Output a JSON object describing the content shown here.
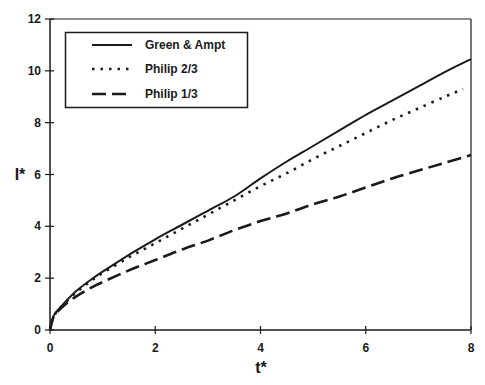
{
  "chart_data": {
    "type": "line",
    "title": "",
    "xlabel": "t*",
    "ylabel": "I*",
    "xlim": [
      0,
      8
    ],
    "ylim": [
      0,
      12
    ],
    "xticks": [
      0,
      2,
      4,
      6,
      8
    ],
    "yticks": [
      0,
      2,
      4,
      6,
      8,
      10,
      12
    ],
    "grid": false,
    "legend_position": "upper left (boxed)",
    "series": [
      {
        "name": "Green & Ampt",
        "style": "solid",
        "x": [
          0,
          0.05,
          0.1,
          0.25,
          0.5,
          0.75,
          1,
          1.5,
          2,
          2.5,
          3,
          3.5,
          4,
          4.5,
          5,
          5.5,
          6,
          6.5,
          7,
          7.5,
          8
        ],
        "y": [
          0,
          0.45,
          0.65,
          1.0,
          1.5,
          1.9,
          2.25,
          2.9,
          3.5,
          4.05,
          4.6,
          5.15,
          5.85,
          6.5,
          7.1,
          7.7,
          8.3,
          8.85,
          9.4,
          9.95,
          10.45
        ]
      },
      {
        "name": "Philip 2/3",
        "style": "dotted",
        "x": [
          0,
          0.05,
          0.1,
          0.25,
          0.5,
          0.75,
          1,
          1.5,
          2,
          2.5,
          3,
          3.5,
          4,
          4.5,
          5,
          5.5,
          6,
          6.5,
          7,
          7.5,
          7.85
        ],
        "y": [
          0,
          0.45,
          0.63,
          0.97,
          1.45,
          1.85,
          2.2,
          2.8,
          3.35,
          3.9,
          4.45,
          5.0,
          5.55,
          6.05,
          6.6,
          7.1,
          7.6,
          8.1,
          8.55,
          9.0,
          9.3
        ]
      },
      {
        "name": "Philip 1/3",
        "style": "dashed",
        "x": [
          0,
          0.05,
          0.1,
          0.25,
          0.5,
          0.75,
          1,
          1.5,
          2,
          2.5,
          3,
          3.5,
          4,
          4.5,
          5,
          5.5,
          6,
          6.5,
          7,
          7.5,
          8
        ],
        "y": [
          0,
          0.4,
          0.6,
          0.92,
          1.3,
          1.6,
          1.85,
          2.3,
          2.7,
          3.1,
          3.45,
          3.85,
          4.2,
          4.5,
          4.85,
          5.15,
          5.5,
          5.85,
          6.15,
          6.45,
          6.75
        ]
      }
    ]
  },
  "legend": {
    "items": [
      {
        "label": "Green & Ampt",
        "style": "solid"
      },
      {
        "label": "Philip 2/3",
        "style": "dotted"
      },
      {
        "label": "Philip 1/3",
        "style": "dashed"
      }
    ]
  },
  "axes": {
    "x_title": "t*",
    "y_title": "I*",
    "x_tick_labels": [
      "0",
      "2",
      "4",
      "6",
      "8"
    ],
    "y_tick_labels": [
      "0",
      "2",
      "4",
      "6",
      "8",
      "10",
      "12"
    ]
  },
  "colors": {
    "line": "#1a1a1a",
    "background": "#ffffff"
  }
}
